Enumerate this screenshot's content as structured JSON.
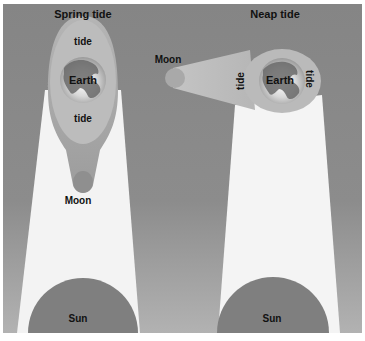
{
  "diagram": {
    "colors": {
      "background_top": "#868686",
      "background_bottom": "#a9a9a9",
      "sunlight": "#f4f4f4",
      "tide_bulge": "#b9b9b9",
      "moon": "#a8a8a8",
      "sun": "#7e7e7e",
      "earth_land": "#6a6a6a",
      "earth_ocean": "#e6e6e6"
    },
    "panels": [
      {
        "title": "Spring tide",
        "earth_label": "Earth",
        "tide_labels": [
          "tide",
          "tide"
        ],
        "moon_label": "Moon",
        "sun_label": "Sun"
      },
      {
        "title": "Neap tide",
        "earth_label": "Earth",
        "tide_labels": [
          "tide",
          "tide"
        ],
        "moon_label": "Moon",
        "sun_label": "Sun"
      }
    ]
  }
}
